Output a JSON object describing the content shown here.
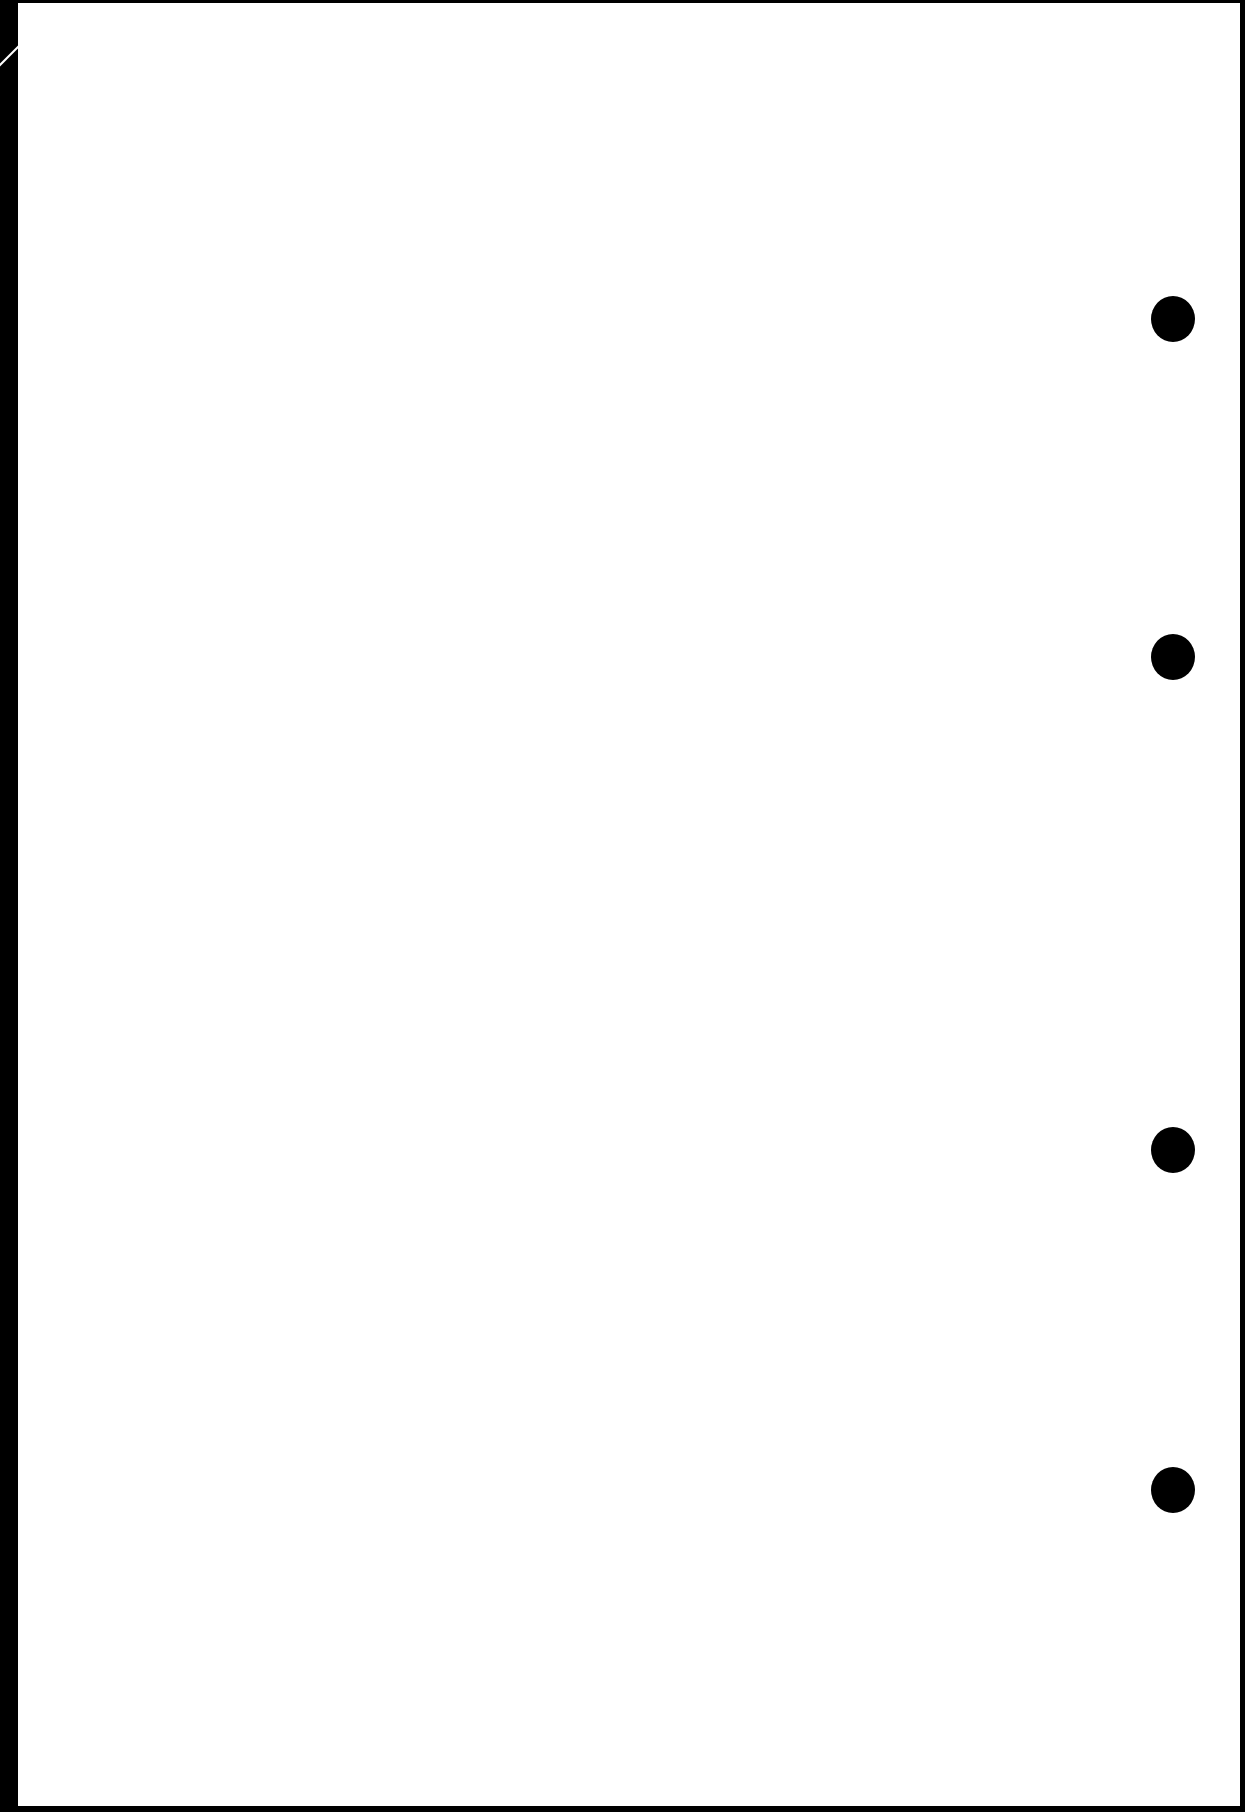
{
  "document": {
    "type": "scanned blank page",
    "text": "",
    "punch_holes": [
      {
        "cx": 1173,
        "cy": 319
      },
      {
        "cx": 1173,
        "cy": 657
      },
      {
        "cx": 1173,
        "cy": 1150
      },
      {
        "cx": 1173,
        "cy": 1490
      }
    ],
    "colors": {
      "page": "#ffffff",
      "border": "#000000"
    }
  }
}
